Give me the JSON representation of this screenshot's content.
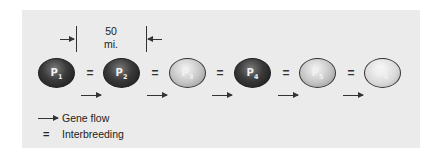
{
  "figure": {
    "scale": {
      "value": "50",
      "unit": "mi."
    },
    "populations": [
      {
        "id": "P",
        "sub": "1",
        "shade": "dark"
      },
      {
        "id": "P",
        "sub": "2",
        "shade": "dark"
      },
      {
        "id": "P",
        "sub": "3",
        "shade": "light"
      },
      {
        "id": "P",
        "sub": "4",
        "shade": "dark"
      },
      {
        "id": "P",
        "sub": "5",
        "shade": "light"
      },
      {
        "id": "P",
        "sub": "6",
        "shade": "lighter"
      }
    ],
    "interbreeding_symbol": "=",
    "legend": {
      "gene_flow": "Gene flow",
      "interbreeding_symbol": "=",
      "interbreeding": "Interbreeding"
    },
    "colors": {
      "panel": "#ebebeb",
      "dark_pop": "#2a2a2a",
      "light_pop": "#c4c4c4",
      "line": "#333333"
    }
  }
}
